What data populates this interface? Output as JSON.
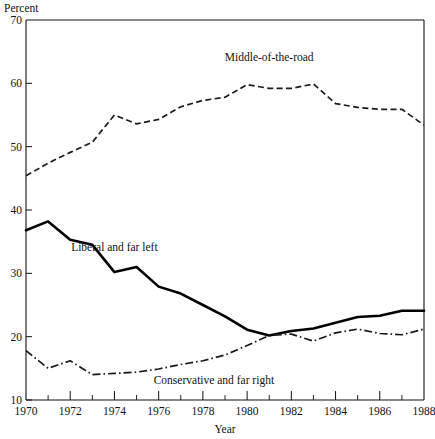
{
  "chart_data": {
    "type": "line",
    "title": "",
    "ylabel": "Percent",
    "xlabel": "Year",
    "ylim": [
      10,
      70
    ],
    "xlim": [
      1970,
      1988
    ],
    "y_ticks": [
      10,
      20,
      30,
      40,
      50,
      60,
      70
    ],
    "x_ticks_major": [
      1970,
      1972,
      1974,
      1976,
      1978,
      1980,
      1982,
      1984,
      1986,
      1988
    ],
    "x_ticks_minor": [
      1971,
      1973,
      1975,
      1977,
      1979,
      1981,
      1983,
      1985,
      1987
    ],
    "x": [
      1970,
      1971,
      1972,
      1973,
      1974,
      1975,
      1976,
      1977,
      1978,
      1979,
      1980,
      1981,
      1982,
      1983,
      1984,
      1985,
      1986,
      1987,
      1988
    ],
    "grid": false,
    "legend_position": "inline-annotations",
    "series": [
      {
        "name": "Middle-of-the-road",
        "style": "dashed",
        "color": "#1a1a1a",
        "label_x": 1981.0,
        "label_y": 63.5,
        "values": [
          45.4,
          47.4,
          49.1,
          50.7,
          55.0,
          53.6,
          54.3,
          56.3,
          57.3,
          57.8,
          59.8,
          59.2,
          59.2,
          59.9,
          56.8,
          56.2,
          55.9,
          55.9,
          53.4
        ]
      },
      {
        "name": "Liberal and far left",
        "style": "solid",
        "color": "#000000",
        "label_x": 1974.0,
        "label_y": 33.6,
        "values": [
          36.8,
          38.2,
          35.3,
          34.5,
          30.2,
          31.0,
          27.9,
          26.8,
          25.0,
          23.2,
          21.1,
          20.2,
          20.9,
          21.3,
          22.2,
          23.1,
          23.3,
          24.1,
          24.1
        ]
      },
      {
        "name": "Conservative and far right",
        "style": "dash-dot",
        "color": "#1a1a1a",
        "label_x": 1978.5,
        "label_y": 12.6,
        "values": [
          17.8,
          15.0,
          16.2,
          14.0,
          14.2,
          14.4,
          14.9,
          15.6,
          16.2,
          17.1,
          18.6,
          20.2,
          20.4,
          19.3,
          20.6,
          21.2,
          20.5,
          20.3,
          21.2
        ]
      }
    ]
  },
  "axis": {
    "y_label_text": "Percent",
    "x_label_text": "Year",
    "y_tick_labels": [
      "10",
      "20",
      "30",
      "40",
      "50",
      "60",
      "70"
    ],
    "x_tick_labels": [
      "1970",
      "1972",
      "1974",
      "1976",
      "1978",
      "1980",
      "1982",
      "1984",
      "1986",
      "1988"
    ]
  }
}
